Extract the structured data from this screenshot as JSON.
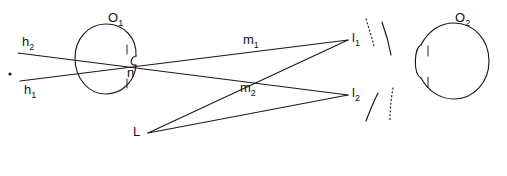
{
  "figure": {
    "background_color": "#ffffff",
    "stroke_color": "#1a1a1a",
    "width": 507,
    "height": 176
  },
  "labels": {
    "object_left": "O",
    "object_left_sub": "1",
    "object_right": "O",
    "object_right_sub": "2",
    "node_center": "n",
    "ray_h2": "h",
    "ray_h2_sub": "2",
    "ray_h1": "h",
    "ray_h1_sub": "1",
    "ray_m1": "m",
    "ray_m1_sub": "1",
    "ray_m2": "m",
    "ray_m2_sub": "2",
    "point_l1": "l",
    "point_l1_sub": "1",
    "point_l2": "l",
    "point_l2_sub": "2",
    "vertex_L": "L"
  },
  "geometry": {
    "circle_left": {
      "cx": 106,
      "cy": 59,
      "r": 31
    },
    "circle_right": {
      "cx": 452,
      "cy": 62,
      "r": 36
    },
    "node_n": {
      "x": 133,
      "y": 72
    },
    "point_l1": {
      "x": 348,
      "y": 40
    },
    "point_l2": {
      "x": 348,
      "y": 95
    },
    "vertex_L": {
      "x": 148,
      "y": 133
    },
    "ray_h2_start": {
      "x": 18,
      "y": 53
    },
    "ray_h1_start": {
      "x": 20,
      "y": 81
    },
    "marker_dot": {
      "x": 10,
      "y": 74
    }
  }
}
